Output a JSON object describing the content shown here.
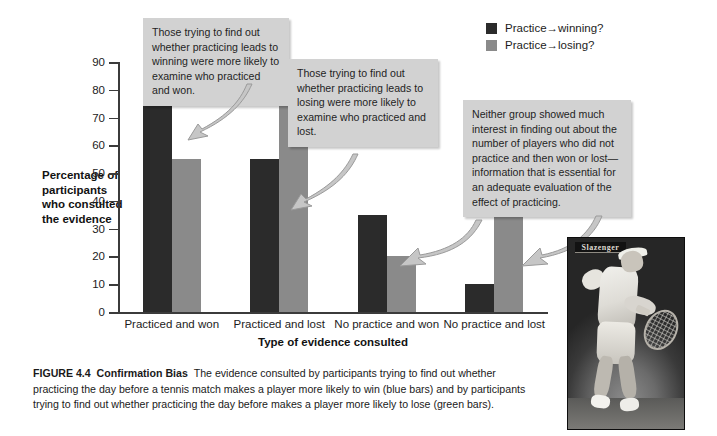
{
  "chart_data": {
    "type": "bar",
    "title": "",
    "categories": [
      "Practiced and won",
      "Practiced and lost",
      "No practice and won",
      "No practice and lost"
    ],
    "series": [
      {
        "name": "Practice→winning?",
        "color": "#2b2b2b",
        "values": [
          75,
          55,
          35,
          10
        ]
      },
      {
        "name": "Practice→losing?",
        "color": "#8a8a8a",
        "values": [
          55,
          85,
          20,
          35
        ]
      }
    ],
    "xlabel": "Type of evidence consulted",
    "ylabel": "Percentage of participants who consulted the evidence",
    "ylim": [
      0,
      90
    ],
    "yticks": [
      0,
      10,
      20,
      30,
      40,
      50,
      60,
      70,
      80,
      90
    ],
    "grid": false,
    "legend_position": "top-right"
  },
  "axis": {
    "y_title": "Percentage of participants who consulted the evidence",
    "x_title": "Type of evidence consulted",
    "y_tick_labels": [
      "0",
      "10",
      "20",
      "30",
      "40",
      "50",
      "60",
      "70",
      "80",
      "90"
    ],
    "x_tick_labels": [
      "Practiced and won",
      "Practiced and lost",
      "No practice and won",
      "No practice and lost"
    ]
  },
  "legend": {
    "items": [
      {
        "label": "Practice→winning?",
        "color": "#2b2b2b"
      },
      {
        "label": "Practice→losing?",
        "color": "#8a8a8a"
      }
    ]
  },
  "callouts": [
    {
      "id": "callout-1",
      "text": "Those trying to find out whether practicing leads to winning were more likely to examine who practiced and won."
    },
    {
      "id": "callout-2",
      "text": "Those trying to find out whether practicing leads to losing were more likely to examine who practiced and lost."
    },
    {
      "id": "callout-3",
      "text": "Neither group showed much interest in finding out about the number of players who did not practice and then won or lost—information that is essential for an adequate evaluation of the effect of practicing."
    }
  ],
  "photo": {
    "alt": "tennis-player-forehand",
    "banner_text": "Slazenger"
  },
  "caption": {
    "figure_number": "FIGURE 4.4",
    "figure_title": "Confirmation Bias",
    "body": "The evidence consulted by participants trying to find out whether practicing the day before a tennis match makes a player more likely to win (blue bars) and by participants trying to find out whether practicing the day before makes a player more likely to lose (green bars)."
  }
}
